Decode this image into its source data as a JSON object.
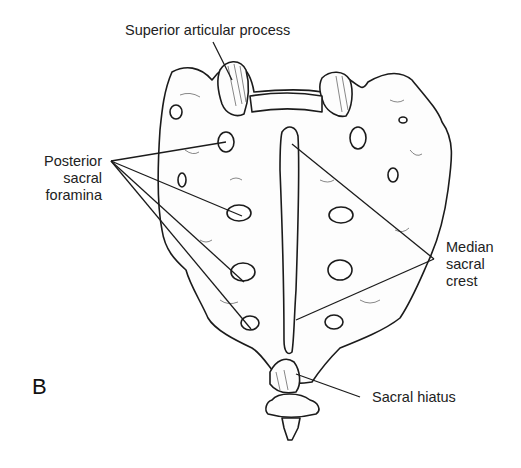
{
  "figure": {
    "panel_letter": "B",
    "labels": {
      "superior_articular_process": "Superior articular process",
      "posterior_sacral_foramina": [
        "Posterior",
        "sacral",
        "foramina"
      ],
      "median_sacral_crest": [
        "Median",
        "sacral",
        "crest"
      ],
      "sacral_hiatus": "Sacral hiatus"
    }
  }
}
